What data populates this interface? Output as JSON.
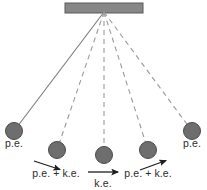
{
  "diagram": {
    "colors": {
      "ceiling_fill": "#878787",
      "ceiling_stroke": "#5a5a5a",
      "bob_fill": "#6e6e6e",
      "bob_stroke": "#4a4a4a",
      "string_solid": "#7a7a7a",
      "string_dashed": "#9a9a9a",
      "arrow": "#1d1d1d",
      "text": "#2b2b2b",
      "background": "#ffffff"
    },
    "ceiling": {
      "name": "support-bar",
      "x": 65,
      "y": 3,
      "width": 78,
      "height": 10
    },
    "pivot": {
      "x": 104,
      "y": 12
    },
    "bob_radius": 8.5,
    "bobs": [
      {
        "id": "bob-1",
        "x": 14,
        "y": 131,
        "string": "solid",
        "label": "p.e."
      },
      {
        "id": "bob-2",
        "x": 57,
        "y": 150,
        "string": "dashed",
        "label": "p.e. + k.e."
      },
      {
        "id": "bob-3",
        "x": 104,
        "y": 155,
        "string": "dashed",
        "label": "k.e."
      },
      {
        "id": "bob-4",
        "x": 148,
        "y": 150,
        "string": "dashed",
        "label": "p.e. + k.e."
      },
      {
        "id": "bob-5",
        "x": 192,
        "y": 131,
        "string": "dashed",
        "label": "p.e."
      }
    ],
    "labels": [
      {
        "id": "label-pe-left",
        "text": "p.e.",
        "x": 14,
        "y": 147,
        "anchor": "middle"
      },
      {
        "id": "label-pe-ke-left",
        "text": "p.e. + k.e.",
        "x": 56,
        "y": 177,
        "anchor": "middle"
      },
      {
        "id": "label-ke-center",
        "text": "k.e.",
        "x": 103,
        "y": 187,
        "anchor": "middle"
      },
      {
        "id": "label-pe-ke-right",
        "text": "p.e. + k.e.",
        "x": 148,
        "y": 177,
        "anchor": "middle"
      },
      {
        "id": "label-pe-right",
        "text": "p.e.",
        "x": 192,
        "y": 147,
        "anchor": "middle"
      }
    ],
    "arrows": [
      {
        "id": "arrow-left-swing",
        "x1": 34,
        "y1": 161,
        "x2": 62,
        "y2": 170,
        "direction": "down-right"
      },
      {
        "id": "arrow-center-swing",
        "x1": 88,
        "y1": 172,
        "x2": 120,
        "y2": 172,
        "direction": "right"
      },
      {
        "id": "arrow-right-swing",
        "x1": 140,
        "y1": 170,
        "x2": 168,
        "y2": 160,
        "direction": "up-right"
      }
    ]
  }
}
